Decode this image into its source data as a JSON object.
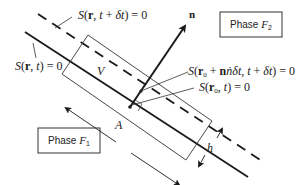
{
  "diagram": {
    "phases": [
      {
        "id": "F2",
        "label": "Phase F₂",
        "prefix": "Phase ",
        "symbol": "F",
        "subscript": "2"
      },
      {
        "id": "F1",
        "label": "Phase F₁",
        "prefix": "Phase ",
        "symbol": "F",
        "subscript": "1"
      }
    ],
    "surfaces": {
      "current": {
        "label": "S(r, t) = 0",
        "style": "solid"
      },
      "future": {
        "label": "S(r, t + δt) = 0",
        "style": "dashed"
      }
    },
    "point_labels": {
      "displaced": "S(r₀ + nṅδt, t + δt) = 0",
      "origin": "S(r₀, t) = 0"
    },
    "vector": {
      "label": "n",
      "meaning": "unit normal"
    },
    "volume": {
      "label": "V"
    },
    "area": {
      "label": "A"
    },
    "thickness": {
      "label": "h"
    },
    "colors": {
      "line": "#1a1a1a",
      "background": "#ffffff"
    }
  }
}
